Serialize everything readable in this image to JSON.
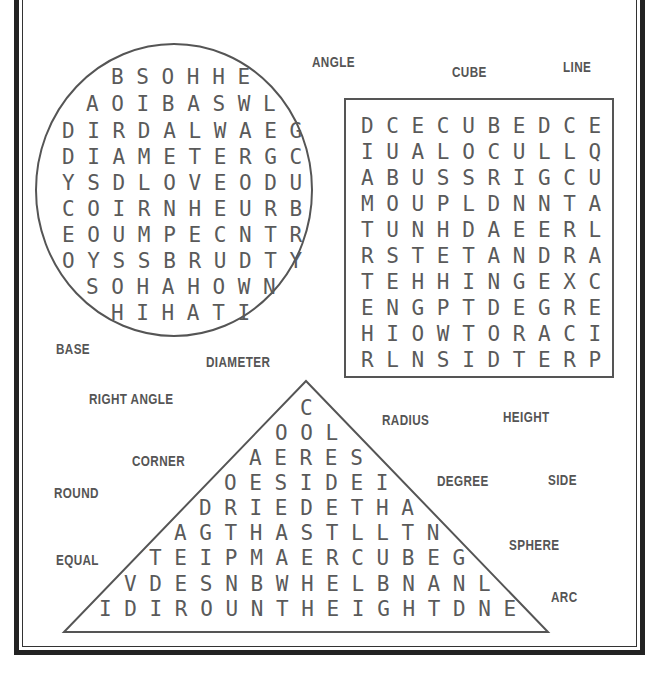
{
  "puzzle": {
    "circle_grid": [
      "B S O H H E",
      "A O I B A S W L",
      "D I R D A L W A E G",
      "D I A M E T E R G C",
      "Y S D L O V E O D U",
      "C O I R N H E U R B",
      "E O U M P E C N T R",
      "O Y S S B R U D T Y",
      "S O H A H O W N",
      "H I H A T I"
    ],
    "square_grid": [
      "D C E C U B E D C E",
      "I U A L O C U L L Q",
      "A B U S S R I G C U",
      "M O U P L D N N T A",
      "T U N H D A E E R L",
      "R S T E T A N D R A",
      "T E H H I N G E X C",
      "E N G P T D E G R E",
      "H I O W T O R A C I",
      "R L N S I D T E R P"
    ],
    "triangle_grid": [
      "C",
      "O O L",
      "A E R E S",
      "O E S I D E I",
      "D R I E D E T H A",
      "A G T H A S T L L T N",
      "T E I P M A E R C U B E G",
      "V D E S N B W H E L B N A N L",
      "I D I R O U N T H E I G H T D N E"
    ],
    "words": [
      "ANGLE",
      "CUBE",
      "LINE",
      "BASE",
      "DIAMETER",
      "RIGHT ANGLE",
      "RADIUS",
      "HEIGHT",
      "CORNER",
      "ROUND",
      "DEGREE",
      "SIDE",
      "EQUAL",
      "SPHERE",
      "ARC"
    ]
  }
}
